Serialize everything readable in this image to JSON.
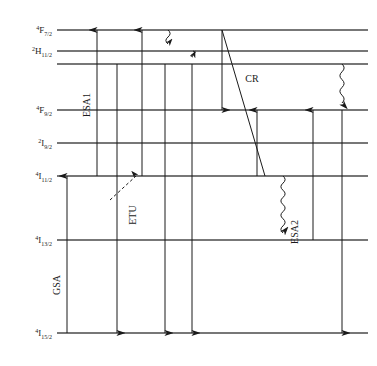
{
  "diagram": {
    "type": "energy-level-diagram",
    "colors": {
      "line": "#4a4a4a",
      "arrow": "#1a1a1a",
      "background": "#ffffff",
      "text": "#1a1a1a"
    },
    "levels": [
      {
        "id": "F7_2",
        "label_sup": "4",
        "label_main": "F",
        "label_sub": "7/2",
        "y": 30,
        "x1": 57,
        "x2": 368,
        "has_label": true
      },
      {
        "id": "H11_2",
        "label_sup": "2",
        "label_main": "H",
        "label_sub": "11/2",
        "y": 51,
        "x1": 57,
        "x2": 368,
        "has_label": true
      },
      {
        "id": "S3_2",
        "label_sup": "",
        "label_main": "",
        "label_sub": "",
        "y": 64,
        "x1": 57,
        "x2": 368,
        "has_label": false
      },
      {
        "id": "F9_2",
        "label_sup": "4",
        "label_main": "F",
        "label_sub": "9/2",
        "y": 110,
        "x1": 57,
        "x2": 368,
        "has_label": true
      },
      {
        "id": "I9_2",
        "label_sup": "2",
        "label_main": "I",
        "label_sub": "9/2",
        "y": 143,
        "x1": 57,
        "x2": 368,
        "has_label": true
      },
      {
        "id": "I11_2",
        "label_sup": "4",
        "label_main": "I",
        "label_sub": "11/2",
        "y": 176,
        "x1": 57,
        "x2": 368,
        "has_label": true
      },
      {
        "id": "I13_2",
        "label_sup": "4",
        "label_main": "I",
        "label_sub": "13/2",
        "y": 240,
        "x1": 57,
        "x2": 368,
        "has_label": true
      },
      {
        "id": "I15_2",
        "label_sup": "4",
        "label_main": "I",
        "label_sub": "15/2",
        "y": 333,
        "x1": 57,
        "x2": 368,
        "has_label": true
      }
    ],
    "process_labels": [
      {
        "id": "gsa",
        "text": "GSA",
        "x": 60,
        "y": 285,
        "rotate": -90
      },
      {
        "id": "esa1",
        "text": "ESA1",
        "x": 90,
        "y": 105,
        "rotate": -90
      },
      {
        "id": "etu",
        "text": "ETU",
        "x": 136,
        "y": 215,
        "rotate": -90
      },
      {
        "id": "cr",
        "text": "CR",
        "x": 252,
        "y": 82,
        "rotate": 0
      },
      {
        "id": "esa2",
        "text": "ESA2",
        "x": 298,
        "y": 232,
        "rotate": -90
      }
    ],
    "transitions": [
      {
        "id": "gsa-up",
        "kind": "straight-up",
        "x": 67,
        "y_from": 333,
        "y_to": 176
      },
      {
        "id": "esa1-up",
        "kind": "straight-up",
        "x": 97,
        "y_from": 176,
        "y_to": 30
      },
      {
        "id": "emission-1-down",
        "kind": "straight-down",
        "x": 117,
        "y_from": 64,
        "y_to": 333
      },
      {
        "id": "etu-up-diagonal",
        "kind": "dashed-diagonal",
        "x_from": 110,
        "y_from": 200,
        "x_to": 136,
        "y_to": 176
      },
      {
        "id": "etu-feed-up",
        "kind": "straight-up",
        "x": 142,
        "y_from": 176,
        "y_to": 30
      },
      {
        "id": "emission-2-down",
        "kind": "straight-down",
        "x": 165,
        "y_from": 64,
        "y_to": 333
      },
      {
        "id": "nonrad-f72-h112",
        "kind": "wavy-down",
        "x": 168,
        "y_from": 30,
        "y_to": 51
      },
      {
        "id": "nonrad-h112-s32",
        "kind": "wavy-down",
        "x": 193,
        "y_from": 51,
        "y_to": 64
      },
      {
        "id": "emission-3-down",
        "kind": "straight-down",
        "x": 192,
        "y_from": 64,
        "y_to": 333
      },
      {
        "id": "cr-down",
        "kind": "straight-down",
        "x": 222,
        "y_from": 30,
        "y_to": 110
      },
      {
        "id": "cr-diagonal",
        "kind": "plain-diagonal",
        "x_from": 222,
        "y_from": 30,
        "x_to": 265,
        "y_to": 176
      },
      {
        "id": "cr-up",
        "kind": "straight-up",
        "x": 257,
        "y_from": 176,
        "y_to": 110
      },
      {
        "id": "nonrad-i112-i132",
        "kind": "wavy-down",
        "x": 283,
        "y_from": 176,
        "y_to": 240
      },
      {
        "id": "esa2-up",
        "kind": "straight-up",
        "x": 313,
        "y_from": 240,
        "y_to": 110
      },
      {
        "id": "nonrad-s32-f92",
        "kind": "wavy-down",
        "x": 342,
        "y_from": 64,
        "y_to": 110
      },
      {
        "id": "emission-4-down",
        "kind": "straight-down",
        "x": 342,
        "y_from": 110,
        "y_to": 333
      }
    ]
  }
}
